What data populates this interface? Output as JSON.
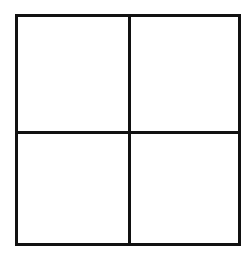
{
  "diagram": {
    "type": "grid",
    "rows": 2,
    "columns": 2,
    "line_color": "#111111",
    "background_color": "#ffffff",
    "cells": [
      {
        "row": 1,
        "col": 1,
        "label": ""
      },
      {
        "row": 1,
        "col": 2,
        "label": ""
      },
      {
        "row": 2,
        "col": 1,
        "label": ""
      },
      {
        "row": 2,
        "col": 2,
        "label": ""
      }
    ]
  }
}
